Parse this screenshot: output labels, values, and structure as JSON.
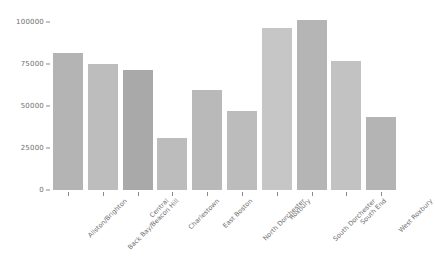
{
  "chart_data": {
    "type": "bar",
    "title": "",
    "subtitle": "",
    "xlabel": "",
    "ylabel": "",
    "grid": false,
    "legend": "none",
    "ylim": [
      0,
      108000
    ],
    "yticks": [
      0,
      25000,
      50000,
      75000,
      100000
    ],
    "ytick_labels": [
      "0",
      "25000",
      "50000",
      "75000",
      "100000"
    ],
    "categories": [
      "Allston/Brighton",
      "Back Bay/Beacon Hill",
      "Central",
      "Charlestown",
      "East Boston",
      "North Dorchester",
      "Roxbury",
      "South Dorchester",
      "South End",
      "West Roxbury"
    ],
    "values": [
      81500,
      75000,
      71500,
      31000,
      59500,
      47000,
      96500,
      101000,
      77000,
      43500
    ],
    "bar_colors": [
      "#b4b4b4",
      "#bdbdbd",
      "#a9a9a9",
      "#bcbcbc",
      "#b9b9b9",
      "#bcbcbc",
      "#c6c6c6",
      "#b5b5b5",
      "#c2c2c2",
      "#b4b4b4"
    ]
  },
  "axis": {
    "tick_color": "#8a8a8a",
    "label_color": "#6f6f6f"
  }
}
